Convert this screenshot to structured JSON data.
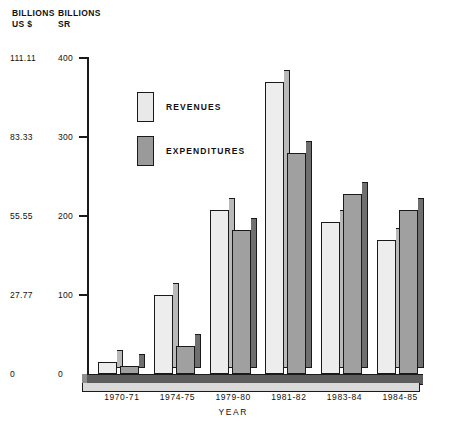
{
  "chart_data": {
    "type": "bar",
    "title": "",
    "xlabel": "YEAR",
    "ylabel_left": "BILLIONS\nUS $",
    "ylabel_right": "BILLIONS\nSR",
    "categories": [
      "1970-71",
      "1974-75",
      "1979-80",
      "1981-82",
      "1983-84",
      "1984-85"
    ],
    "series": [
      {
        "name": "REVENUES",
        "values": [
          15,
          100,
          208,
          370,
          193,
          170
        ],
        "unit": "SR billions",
        "color": "#ededed"
      },
      {
        "name": "EXPENDITURES",
        "values": [
          10,
          35,
          182,
          280,
          228,
          207
        ],
        "unit": "SR billions",
        "color": "#a0a0a0"
      }
    ],
    "ylim_right": [
      0,
      400
    ],
    "ylim_left": [
      0,
      111.11
    ],
    "yticks_right": [
      "0",
      "100",
      "200",
      "300",
      "400"
    ],
    "yticks_left": [
      "0",
      "27.77",
      "55.55",
      "83.33",
      "111.11"
    ],
    "grid": false,
    "legend_position": "upper-left-inside"
  },
  "axis_headers": {
    "left_line1": "BILLIONS",
    "left_line2": "US $",
    "right_line1": "BILLIONS",
    "right_line2": "SR"
  },
  "legend": {
    "revenues_label": "REVENUES",
    "expenditures_label": "EXPENDITURES"
  },
  "ticks": [
    {
      "left": "111.11",
      "right": "400"
    },
    {
      "left": "83.33",
      "right": "300"
    },
    {
      "left": "55.55",
      "right": "200"
    },
    {
      "left": "27.77",
      "right": "100"
    },
    {
      "left": "0",
      "right": "0"
    }
  ],
  "colors": {
    "revenues": "#ededed",
    "expenditures": "#a0a0a0",
    "axis": "#1a1a1a",
    "background": "#ffffff"
  }
}
